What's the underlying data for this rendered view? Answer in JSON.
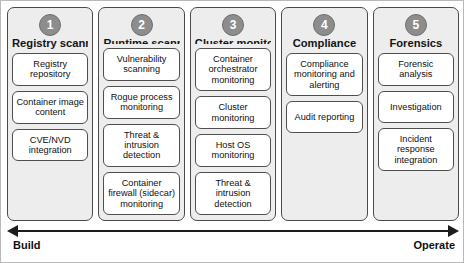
{
  "diagram": {
    "columns": [
      {
        "number": "1",
        "title": "Registry scanning",
        "cards": [
          "Registry repository",
          "Container image content",
          "CVE/NVD integration"
        ]
      },
      {
        "number": "2",
        "title": "Runtime scanning",
        "cards": [
          "Vulnerability scanning",
          "Rogue process monitoring",
          "Threat & intrusion detection",
          "Container firewall (sidecar) monitoring"
        ]
      },
      {
        "number": "3",
        "title": "Cluster monitoring",
        "cards": [
          "Container orchestrator monitoring",
          "Cluster monitoring",
          "Host OS monitoring",
          "Threat & intrusion detection"
        ]
      },
      {
        "number": "4",
        "title": "Compliance",
        "cards": [
          "Compliance monitoring and alerting",
          "Audit reporting"
        ]
      },
      {
        "number": "5",
        "title": "Forensics",
        "cards": [
          "Forensic analysis",
          "Investigation",
          "Incident response integration"
        ]
      }
    ],
    "axis": {
      "left_label": "Build",
      "right_label": "Operate"
    },
    "colors": {
      "panel_fill": "#ededed",
      "card_fill": "#ffffff",
      "badge_fill": "#8d8d8d",
      "stroke": "#4a4a4a",
      "text": "#101010"
    }
  }
}
